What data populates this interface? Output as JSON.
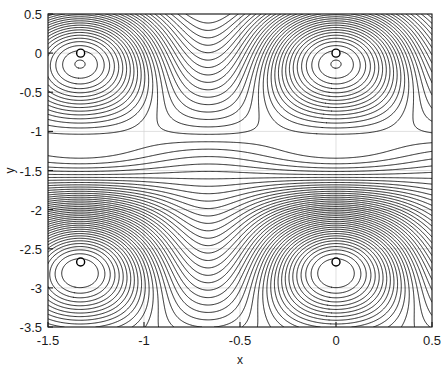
{
  "figure": {
    "background_color": "#ffffff",
    "line_color": "#000000",
    "grid_color": "#d2d2d2",
    "axis_color": "#1a1a1a"
  },
  "axes": {
    "xlabel": "x",
    "ylabel": "y",
    "xlim": [
      -1.5,
      0.5
    ],
    "ylim": [
      -3.5,
      0.5
    ],
    "xticks": [
      -1.5,
      -1,
      -0.5,
      0,
      0.5
    ],
    "yticks": [
      0.5,
      0,
      -0.5,
      -1,
      -1.5,
      -2,
      -2.5,
      -3,
      -3.5
    ],
    "xtick_labels": [
      "-1.5",
      "-1",
      "-0.5",
      "0",
      "0.5"
    ],
    "ytick_labels": [
      "0.5",
      "0",
      "-0.5",
      "-1",
      "-1.5",
      "-2",
      "-2.5",
      "-3",
      "-3.5"
    ],
    "grid": true,
    "box": true
  },
  "chart_data": {
    "type": "line",
    "title": "",
    "xlabel": "x",
    "ylabel": "y",
    "xlim": [
      -1.5,
      0.5
    ],
    "ylim": [
      -3.5,
      0.5
    ],
    "grid": true,
    "legend": "none",
    "plot_kind": "contour",
    "xticks": [
      -1.5,
      -1,
      -0.5,
      0,
      0.5
    ],
    "yticks": [
      0.5,
      0,
      -0.5,
      -1,
      -1.5,
      -2,
      -2.5,
      -3,
      -3.5
    ],
    "markers": {
      "style": "open-circle",
      "edge_color": "#000000",
      "face_color": "#ffffff",
      "radius_px": 4,
      "points": [
        {
          "x": -1.33,
          "y": 0.0
        },
        {
          "x": 0.0,
          "y": 0.0
        },
        {
          "x": -1.33,
          "y": -2.67
        },
        {
          "x": 0.0,
          "y": -2.67
        }
      ]
    },
    "contour_levels_count": 58,
    "series": [
      {
        "name": "contour-lines",
        "values": []
      }
    ]
  }
}
